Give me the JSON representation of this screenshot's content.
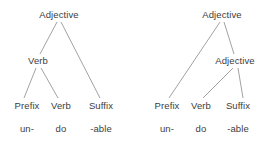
{
  "figure": {
    "background_color": "#ffffff",
    "text_color": "#3d3d3a",
    "edge_color": "#8a8a8a"
  },
  "trees": [
    {
      "id": "left-tree",
      "nodes": [
        {
          "id": "l-root",
          "label": "Adjective",
          "x": 59,
          "y": 14
        },
        {
          "id": "l-verb",
          "label": "Verb",
          "x": 38,
          "y": 60
        },
        {
          "id": "l-prefix",
          "label": "Prefix",
          "x": 27,
          "y": 105
        },
        {
          "id": "l-verb2",
          "label": "Verb",
          "x": 61,
          "y": 105
        },
        {
          "id": "l-suffix",
          "label": "Suffix",
          "x": 101,
          "y": 105
        }
      ],
      "words": [
        {
          "id": "l-word-un",
          "label": "un-",
          "x": 27,
          "y": 128
        },
        {
          "id": "l-word-do",
          "label": "do",
          "x": 61,
          "y": 128
        },
        {
          "id": "l-word-able",
          "label": "-able",
          "x": 101,
          "y": 128
        }
      ],
      "edges": [
        {
          "from": "l-root",
          "to": "l-verb",
          "x1": 57,
          "y1": 22,
          "x2": 40,
          "y2": 54
        },
        {
          "from": "l-root",
          "to": "l-suffix",
          "x1": 61,
          "y1": 22,
          "x2": 100,
          "y2": 98
        },
        {
          "from": "l-verb",
          "to": "l-prefix",
          "x1": 36,
          "y1": 68,
          "x2": 24,
          "y2": 98
        },
        {
          "from": "l-verb",
          "to": "l-verb2",
          "x1": 41,
          "y1": 68,
          "x2": 58,
          "y2": 98
        }
      ]
    },
    {
      "id": "right-tree",
      "nodes": [
        {
          "id": "r-root",
          "label": "Adjective",
          "x": 222,
          "y": 14
        },
        {
          "id": "r-adj",
          "label": "Adjective",
          "x": 235,
          "y": 60
        },
        {
          "id": "r-prefix",
          "label": "Prefix",
          "x": 167,
          "y": 105
        },
        {
          "id": "r-verb",
          "label": "Verb",
          "x": 201,
          "y": 105
        },
        {
          "id": "r-suffix",
          "label": "Suffix",
          "x": 238,
          "y": 105
        }
      ],
      "words": [
        {
          "id": "r-word-un",
          "label": "un-",
          "x": 167,
          "y": 128
        },
        {
          "id": "r-word-do",
          "label": "do",
          "x": 201,
          "y": 128
        },
        {
          "id": "r-word-able",
          "label": "-able",
          "x": 238,
          "y": 128
        }
      ],
      "edges": [
        {
          "from": "r-root",
          "to": "r-prefix",
          "x1": 220,
          "y1": 22,
          "x2": 169,
          "y2": 98
        },
        {
          "from": "r-root",
          "to": "r-adj",
          "x1": 224,
          "y1": 22,
          "x2": 234,
          "y2": 54
        },
        {
          "from": "r-adj",
          "to": "r-verb",
          "x1": 233,
          "y1": 68,
          "x2": 203,
          "y2": 98
        },
        {
          "from": "r-adj",
          "to": "r-suffix",
          "x1": 238,
          "y1": 68,
          "x2": 243,
          "y2": 98
        }
      ]
    }
  ]
}
